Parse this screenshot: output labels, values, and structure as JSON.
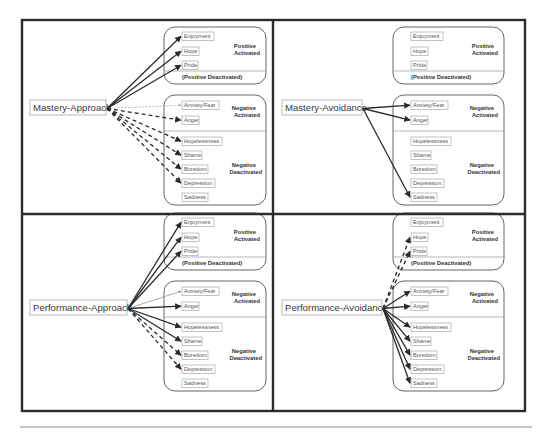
{
  "figure": {
    "frame": {
      "x": 22,
      "y": 20,
      "w": 503,
      "h": 391
    },
    "divider": {
      "x": 273,
      "y": 214
    },
    "bottom_rule": {
      "x1": 20,
      "x2": 532,
      "y": 427
    },
    "categories": {
      "positive_activated": [
        "Positive",
        "Activated"
      ],
      "positive_deactivated": "(Positive Deactivated)",
      "negative_activated": [
        "Negative",
        "Activated"
      ],
      "negative_deactivated": [
        "Negative",
        "Deactivated"
      ]
    },
    "emotions": {
      "positive": [
        "Enjoyment",
        "Hope",
        "Pride"
      ],
      "negative_activated": [
        "Anxiety/Fear",
        "Anger"
      ],
      "negative_deactivated": [
        "Hopelessness",
        "Shame",
        "Boredom",
        "Depression",
        "Sadness"
      ]
    },
    "panels": [
      {
        "id": "mastery-approach",
        "goal": "Mastery-Approach",
        "origin": {
          "x": 22,
          "y": 20
        },
        "goal_box": {
          "x": 30,
          "y": 100,
          "w": 76,
          "h": 15
        },
        "links": [
          {
            "to": "Enjoyment",
            "style": "solid"
          },
          {
            "to": "Hope",
            "style": "solid"
          },
          {
            "to": "Pride",
            "style": "solid"
          },
          {
            "to": "Anxiety/Fear",
            "style": "dotted-thin"
          },
          {
            "to": "Anger",
            "style": "dashed"
          },
          {
            "to": "Hopelessness",
            "style": "dashed"
          },
          {
            "to": "Shame",
            "style": "dashed"
          },
          {
            "to": "Boredom",
            "style": "dashed"
          },
          {
            "to": "Depression",
            "style": "dashed"
          }
        ]
      },
      {
        "id": "mastery-avoidance",
        "goal": "Mastery-Avoidance",
        "origin": {
          "x": 273,
          "y": 20
        },
        "goal_box": {
          "x": 282,
          "y": 100,
          "w": 80,
          "h": 15
        },
        "links": [
          {
            "to": "Anxiety/Fear",
            "style": "solid"
          },
          {
            "to": "Anger",
            "style": "solid"
          },
          {
            "to": "Sadness",
            "style": "solid"
          }
        ]
      },
      {
        "id": "performance-approach",
        "goal": "Performance-Approach",
        "origin": {
          "x": 22,
          "y": 214
        },
        "goal_box": {
          "x": 30,
          "y": 300,
          "w": 97,
          "h": 15
        },
        "links": [
          {
            "to": "Enjoyment",
            "style": "solid"
          },
          {
            "to": "Hope",
            "style": "solid"
          },
          {
            "to": "Pride",
            "style": "solid"
          },
          {
            "to": "Anxiety/Fear",
            "style": "thin"
          },
          {
            "to": "Anger",
            "style": "solid"
          },
          {
            "to": "Hopelessness",
            "style": "solid"
          },
          {
            "to": "Shame",
            "style": "solid"
          },
          {
            "to": "Boredom",
            "style": "dashed"
          },
          {
            "to": "Depression",
            "style": "dashed"
          }
        ]
      },
      {
        "id": "performance-avoidance",
        "goal": "Performance-Avoidance",
        "origin": {
          "x": 273,
          "y": 214
        },
        "goal_box": {
          "x": 282,
          "y": 300,
          "w": 100,
          "h": 15
        },
        "links": [
          {
            "to": "Hope",
            "style": "dashed"
          },
          {
            "to": "Pride",
            "style": "dashed"
          },
          {
            "to": "Anxiety/Fear",
            "style": "solid"
          },
          {
            "to": "Anger",
            "style": "solid"
          },
          {
            "to": "Hopelessness",
            "style": "solid"
          },
          {
            "to": "Shame",
            "style": "solid"
          },
          {
            "to": "Boredom",
            "style": "solid"
          },
          {
            "to": "Depression",
            "style": "solid"
          },
          {
            "to": "Sadness",
            "style": "solid"
          }
        ]
      }
    ]
  }
}
